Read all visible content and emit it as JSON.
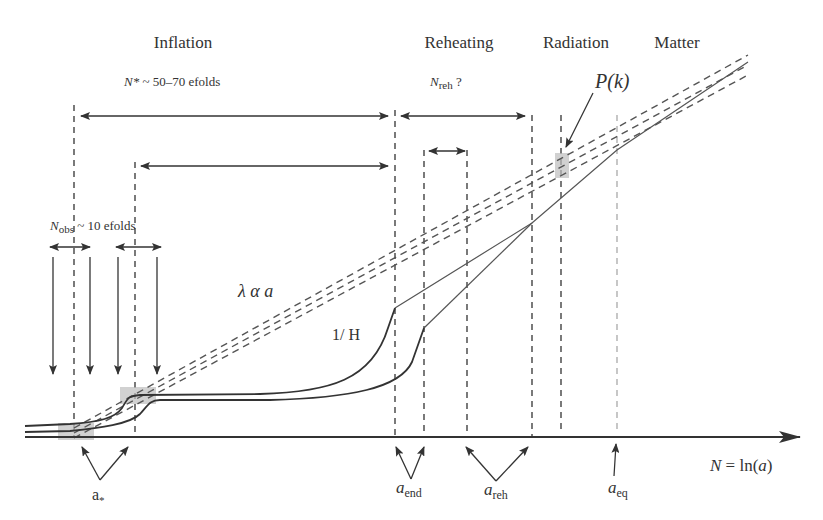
{
  "figure": {
    "phases": {
      "inflation": "Inflation",
      "reheating": "Reheating",
      "radiation": "Radiation",
      "matter": "Matter"
    },
    "annotations": {
      "n_star": "N* ~ 50–70 efolds",
      "n_star_symbol": "N*",
      "n_star_rest": " ~ 50–70 efolds",
      "n_reh_symbol": "N",
      "n_reh_sub": "reh",
      "n_reh_rest": " ?",
      "n_obs_symbol": "N",
      "n_obs_sub": "obs",
      "n_obs_rest": " ~ 10 efolds",
      "power_spectrum": "P(k)",
      "wavelength": "λ α a",
      "hubble_radius": "1/ H"
    },
    "axis": {
      "label_lhs": "N",
      "label_eq": " = ln(",
      "label_var": "a",
      "label_close": ")",
      "label": "N = ln(a)"
    },
    "markers": {
      "a_star": "a",
      "a_star_sub": "*",
      "a_end": "a",
      "a_end_sub": "end",
      "a_reh": "a",
      "a_reh_sub": "reh",
      "a_eq": "a",
      "a_eq_sub": "eq"
    },
    "colors": {
      "ink": "#333333",
      "dashed": "#555555",
      "highlight": "#bdbdbd"
    }
  }
}
